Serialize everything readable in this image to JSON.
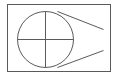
{
  "diagram": {
    "type": "technical-line-drawing",
    "stroke_color": "#5a5a5a",
    "background": "#ffffff",
    "frame": {
      "x": 7,
      "y": 4,
      "width": 103,
      "height": 67
    },
    "circle": {
      "cx": 45,
      "cy": 39,
      "r": 28
    },
    "crosshair": {
      "vertical": {
        "x1": 45,
        "y1": 11,
        "x2": 45,
        "y2": 67
      },
      "horizontal": {
        "x1": 17,
        "y1": 39,
        "x2": 73,
        "y2": 39
      }
    },
    "tangent_lines": [
      {
        "name": "upper",
        "x1": 57,
        "y1": 11,
        "x2": 103,
        "y2": 29
      },
      {
        "name": "lower",
        "x1": 57,
        "y1": 67,
        "x2": 103,
        "y2": 50
      }
    ]
  }
}
